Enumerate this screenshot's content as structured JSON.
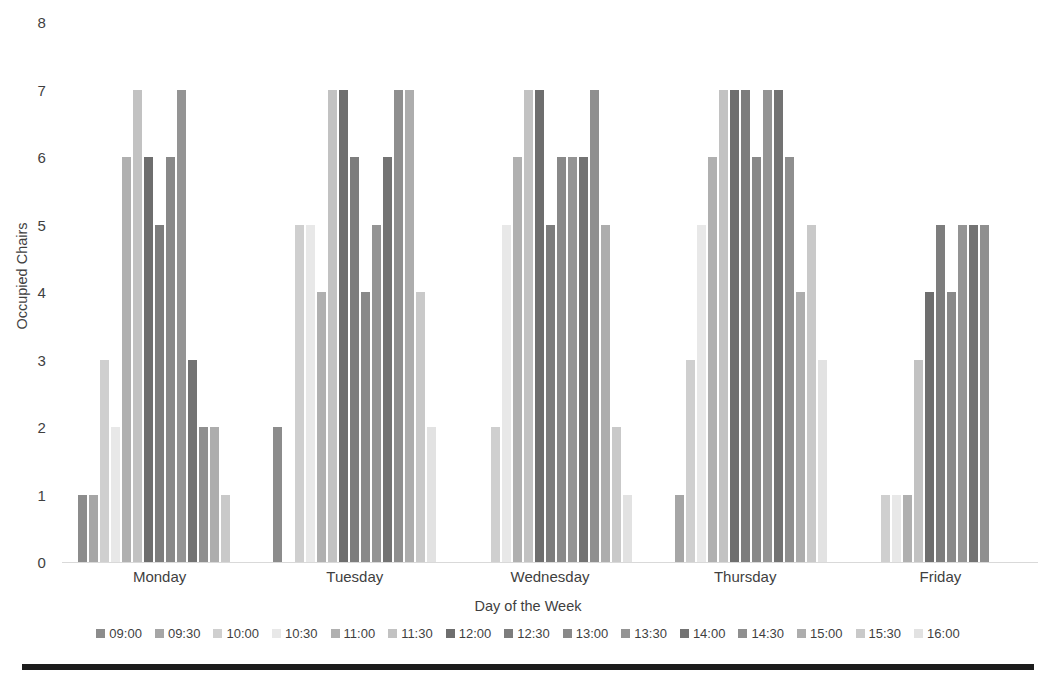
{
  "chart_data": {
    "type": "bar",
    "title": "",
    "xlabel": "Day of the Week",
    "ylabel": "Occupied Chairs",
    "ylim": [
      0,
      8
    ],
    "ytick_step": 1,
    "yticks": [
      0,
      1,
      2,
      3,
      4,
      5,
      6,
      7,
      8
    ],
    "grid": false,
    "legend_position": "bottom",
    "categories": [
      "Monday",
      "Tuesday",
      "Wednesday",
      "Thursday",
      "Friday"
    ],
    "series": [
      {
        "name": "09:00",
        "color": "#8c8c8c",
        "values": [
          1,
          2,
          0,
          0,
          0
        ]
      },
      {
        "name": "09:30",
        "color": "#a6a6a6",
        "values": [
          1,
          0,
          0,
          1,
          0
        ]
      },
      {
        "name": "10:00",
        "color": "#cfcfcf",
        "values": [
          3,
          5,
          2,
          3,
          1
        ]
      },
      {
        "name": "10:30",
        "color": "#e8e8e8",
        "values": [
          2,
          5,
          5,
          5,
          1
        ]
      },
      {
        "name": "11:00",
        "color": "#b0b0b0",
        "values": [
          6,
          4,
          6,
          6,
          1
        ]
      },
      {
        "name": "11:30",
        "color": "#c2c2c2",
        "values": [
          7,
          7,
          7,
          7,
          3
        ]
      },
      {
        "name": "12:00",
        "color": "#6e6e6e",
        "values": [
          6,
          7,
          7,
          7,
          4
        ]
      },
      {
        "name": "12:30",
        "color": "#7d7d7d",
        "values": [
          5,
          6,
          5,
          7,
          5
        ]
      },
      {
        "name": "13:00",
        "color": "#898989",
        "values": [
          6,
          4,
          6,
          6,
          4
        ]
      },
      {
        "name": "13:30",
        "color": "#949494",
        "values": [
          7,
          5,
          6,
          7,
          5
        ]
      },
      {
        "name": "14:00",
        "color": "#737373",
        "values": [
          3,
          6,
          6,
          7,
          5
        ]
      },
      {
        "name": "14:30",
        "color": "#8f8f8f",
        "values": [
          2,
          7,
          7,
          6,
          5
        ]
      },
      {
        "name": "15:00",
        "color": "#adadad",
        "values": [
          2,
          7,
          5,
          4,
          0
        ]
      },
      {
        "name": "15:30",
        "color": "#c9c9c9",
        "values": [
          1,
          4,
          2,
          5,
          0
        ]
      },
      {
        "name": "16:00",
        "color": "#e2e2e2",
        "values": [
          0,
          2,
          1,
          3,
          0
        ]
      }
    ]
  },
  "axis": {
    "y_title": "Occupied Chairs",
    "x_title": "Day of the Week",
    "y_ticks": [
      "8",
      "7",
      "6",
      "5",
      "4",
      "3",
      "2",
      "1",
      "0"
    ],
    "x_ticks": [
      "Monday",
      "Tuesday",
      "Wednesday",
      "Thursday",
      "Friday"
    ]
  },
  "legend": {
    "entries": [
      "09:00",
      "09:30",
      "10:00",
      "10:30",
      "11:00",
      "11:30",
      "12:00",
      "12:30",
      "13:00",
      "13:30",
      "14:00",
      "14:30",
      "15:00",
      "15:30",
      "16:00"
    ]
  },
  "style": {
    "axis_line_color": "#d9d9d9",
    "text_color": "#3f3f3f",
    "bottom_rule_color": "#1c1c1c",
    "background": "#ffffff"
  }
}
